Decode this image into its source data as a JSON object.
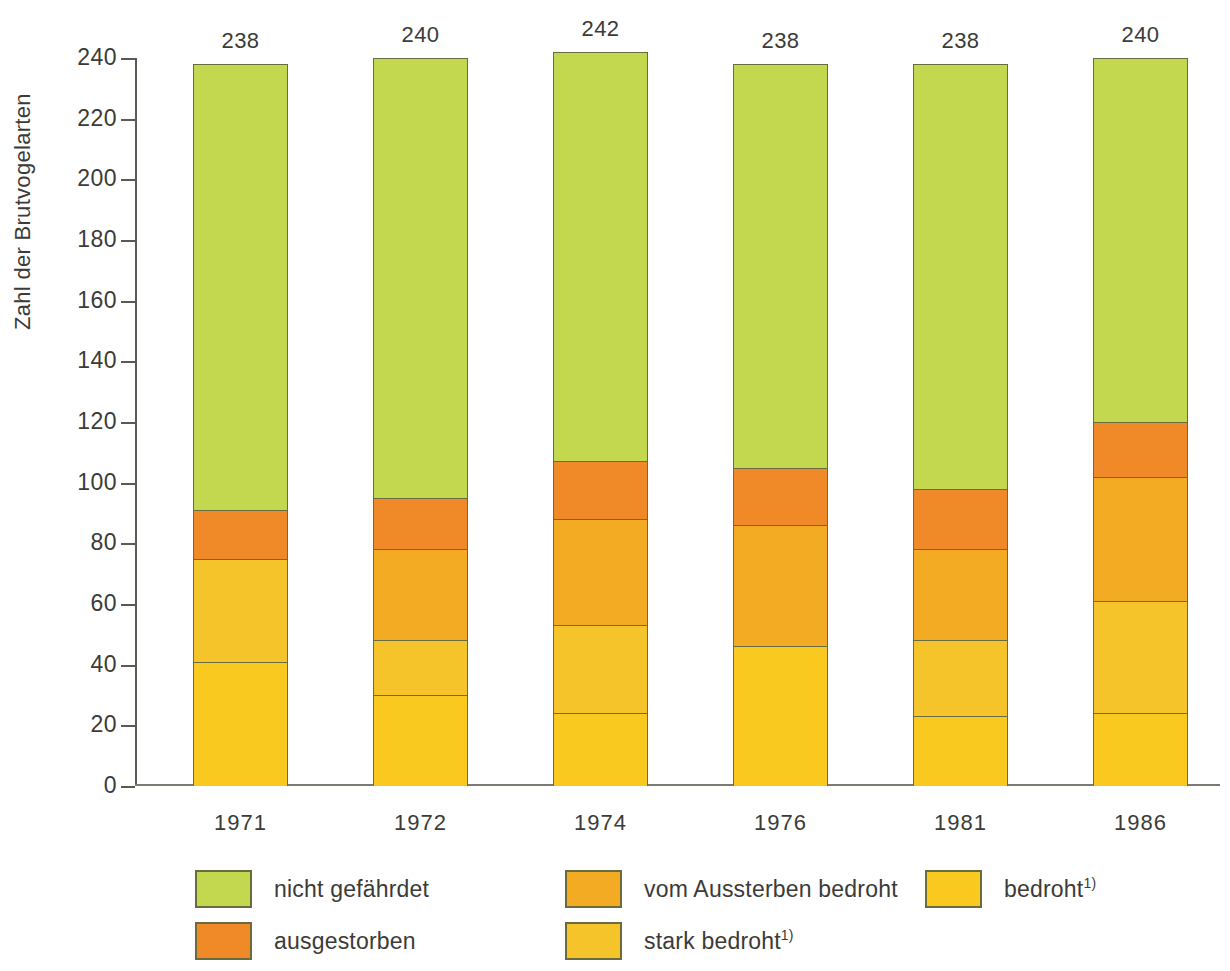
{
  "chart_data": {
    "type": "bar",
    "subtype": "stacked-bar",
    "title": "",
    "xlabel": "",
    "ylabel": "Zahl der Brutvogelarten",
    "ylim": [
      0,
      240
    ],
    "ytick_step": 20,
    "yticks": [
      240,
      220,
      200,
      180,
      160,
      140,
      120,
      100,
      80,
      60,
      40,
      20,
      0
    ],
    "grid": false,
    "legend_position": "bottom",
    "categories": [
      "1971",
      "1972",
      "1974",
      "1976",
      "1981",
      "1986"
    ],
    "totals": [
      238,
      240,
      242,
      238,
      238,
      240
    ],
    "series": [
      {
        "name": "bedroht",
        "name_full": "bedroht",
        "footnote": "1)",
        "color": "#f9c920",
        "values": [
          41,
          30,
          24,
          46,
          23,
          24
        ]
      },
      {
        "name": "stark bedroht",
        "name_full": "stark bedroht",
        "footnote": "1)",
        "color": "#f5c32a",
        "values": [
          34,
          18,
          29,
          0,
          25,
          37
        ]
      },
      {
        "name": "vom Aussterben bedroht",
        "name_full": "vom Aussterben bedroht",
        "footnote": "",
        "color": "#f4ab24",
        "values": [
          0,
          30,
          35,
          40,
          30,
          41
        ]
      },
      {
        "name": "ausgestorben",
        "name_full": "ausgestorben",
        "footnote": "",
        "color": "#f08a28",
        "values": [
          16,
          17,
          19,
          19,
          20,
          18
        ]
      },
      {
        "name": "nicht gefährdet",
        "name_full": "nicht gefährdet",
        "footnote": "",
        "color": "#c3d84f",
        "values": [
          147,
          145,
          135,
          133,
          140,
          120
        ]
      }
    ],
    "stack_order_bottom_to_top": [
      "bedroht",
      "stark bedroht",
      "vom Aussterben bedroht",
      "ausgestorben",
      "nicht gefährdet"
    ]
  },
  "axis": {
    "y_title": "Zahl der Brutvogelarten",
    "y_tick_labels": [
      "240",
      "220",
      "200",
      "180",
      "160",
      "140",
      "120",
      "100",
      "80",
      "60",
      "40",
      "20",
      "0"
    ],
    "x_tick_labels": [
      "1971",
      "1972",
      "1974",
      "1976",
      "1981",
      "1986"
    ]
  },
  "bar_labels": [
    "238",
    "240",
    "242",
    "238",
    "238",
    "240"
  ],
  "legend": {
    "items": [
      {
        "label": "nicht gefährdet",
        "footnote": "",
        "color": "#c3d84f",
        "col": 0,
        "row": 0
      },
      {
        "label": "ausgestorben",
        "footnote": "",
        "color": "#f08a28",
        "col": 0,
        "row": 1
      },
      {
        "label": "vom Aussterben bedroht",
        "footnote": "",
        "color": "#f4ab24",
        "col": 1,
        "row": 0
      },
      {
        "label": "stark bedroht",
        "footnote": "1)",
        "color": "#f5c32a",
        "col": 1,
        "row": 1
      },
      {
        "label": "bedroht",
        "footnote": "1)",
        "color": "#f9c920",
        "col": 2,
        "row": 0
      }
    ]
  },
  "colors": {
    "nicht_gefaehrdet": "#c3d84f",
    "ausgestorben": "#f08a28",
    "vom_aussterben_bedroht": "#f4ab24",
    "stark_bedroht": "#f5c32a",
    "bedroht": "#f9c920",
    "outline": "#6b6b40",
    "axis": "#5a5a52",
    "text": "#3b3b38",
    "background": "#ffffff"
  }
}
